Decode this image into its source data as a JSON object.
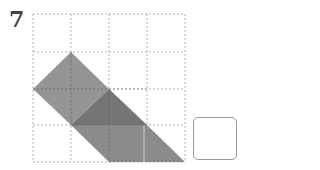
{
  "problem": {
    "number": "7"
  },
  "grid": {
    "rows": 4,
    "cols": 4,
    "left": 33,
    "top": 14,
    "cell": 38,
    "line_color": "#b0b0b0"
  },
  "shapes": {
    "square_color": "#8a8a8a",
    "triangle_color": "#6e6e6e",
    "parallelogram_color": "#858585"
  },
  "answer_box": {
    "value": ""
  }
}
